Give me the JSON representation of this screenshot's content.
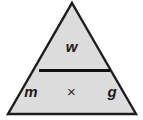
{
  "figure": {
    "type": "formula-triangle",
    "fill_color": "#dcdcdc",
    "outline_color": "#1c1c1c",
    "background_color": "#ffffff",
    "text_color": "#1a1a1a"
  },
  "triangle": {
    "apex": {
      "x": 72,
      "y": 2
    },
    "bottom_left": {
      "x": 8,
      "y": 115
    },
    "bottom_right": {
      "x": 136,
      "y": 115
    },
    "outline_width": 2
  },
  "divider": {
    "x_start": 39,
    "x_end": 110,
    "y": 70,
    "thickness": 3,
    "color": "#111111"
  },
  "numerator": {
    "label": "w"
  },
  "denominator": {
    "left_factor": "m",
    "operator": "×",
    "right_factor": "g"
  }
}
